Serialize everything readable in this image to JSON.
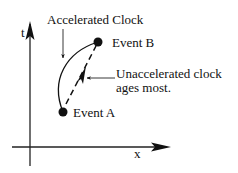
{
  "diagram": {
    "type": "spacetime-diagram",
    "axes": {
      "vertical_label": "t",
      "horizontal_label": "x"
    },
    "events": [
      {
        "id": "A",
        "label": "Event A"
      },
      {
        "id": "B",
        "label": "Event B"
      }
    ],
    "annotations": {
      "accelerated": "Accelerated Clock",
      "unaccelerated_line1": "Unaccelerated clock",
      "unaccelerated_line2": "ages most."
    },
    "colors": {
      "ink": "#111111",
      "background": "#ffffff"
    }
  }
}
